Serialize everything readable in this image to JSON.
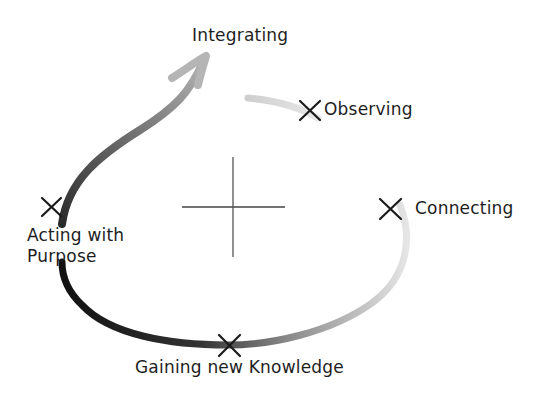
{
  "diagram": {
    "type": "cycle",
    "center_mark": "plus-sign",
    "stages": [
      {
        "id": "observing",
        "label": "Observing"
      },
      {
        "id": "connecting",
        "label": "Connecting"
      },
      {
        "id": "gaining",
        "label": "Gaining new Knowledge"
      },
      {
        "id": "acting",
        "label": "Acting with Purpose"
      },
      {
        "id": "integrating",
        "label": "Integrating"
      }
    ],
    "colors": {
      "text": "#1e1e1e",
      "stroke_dark": "#111111",
      "stroke_light": "#dddddd"
    }
  }
}
